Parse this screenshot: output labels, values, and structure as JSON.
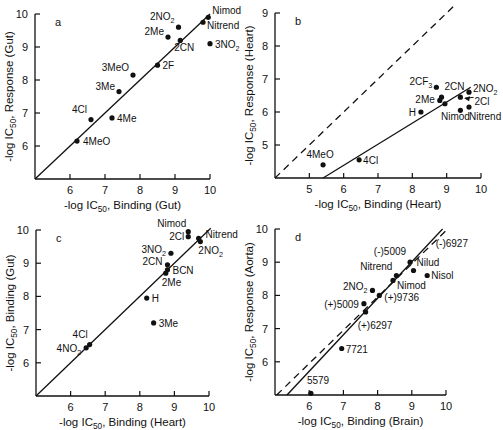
{
  "figure": {
    "panels": [
      "a",
      "b",
      "c",
      "d"
    ]
  },
  "chart_data": [
    {
      "id": "a",
      "type": "scatter",
      "panel_label": "a",
      "xlabel": "-log IC50, Binding (Gut)",
      "ylabel": "-log IC50, Response (Gut)",
      "xlim": [
        5,
        10
      ],
      "ylim": [
        5,
        10
      ],
      "xticks": [
        "6",
        "7",
        "8",
        "9",
        "10"
      ],
      "yticks": [
        "6",
        "7",
        "8",
        "9",
        "10"
      ],
      "box": {
        "x0": 35,
        "x1": 210,
        "y0": 179,
        "y1": 14
      },
      "lines": [
        {
          "style": "solid",
          "from": [
            5,
            5
          ],
          "to": [
            10,
            10
          ]
        }
      ],
      "points": [
        {
          "label": "4MeO",
          "x": 6.2,
          "y": 6.15,
          "lx": 6,
          "ly": 4,
          "anchor": "start"
        },
        {
          "label": "4Cl",
          "x": 6.6,
          "y": 6.8,
          "lx": -4,
          "ly": -7,
          "anchor": "end"
        },
        {
          "label": "4Me",
          "x": 7.2,
          "y": 6.85,
          "lx": 5,
          "ly": 4,
          "anchor": "start"
        },
        {
          "label": "3Me",
          "x": 7.4,
          "y": 7.65,
          "lx": -4,
          "ly": -2,
          "anchor": "end"
        },
        {
          "label": "3MeO",
          "x": 7.8,
          "y": 8.15,
          "lx": -4,
          "ly": -4,
          "anchor": "end"
        },
        {
          "label": "2F",
          "x": 8.5,
          "y": 8.45,
          "lx": 5,
          "ly": 4,
          "anchor": "start"
        },
        {
          "label": "2Me",
          "x": 8.8,
          "y": 9.3,
          "lx": -4,
          "ly": -2,
          "anchor": "end"
        },
        {
          "label": "2CN",
          "x": 9.15,
          "y": 9.2,
          "lx": -6,
          "ly": 11,
          "anchor": "start"
        },
        {
          "label": "2NO2",
          "x": 9.1,
          "y": 9.6,
          "lx": -4,
          "ly": -7,
          "anchor": "end"
        },
        {
          "label": "Nitrend",
          "x": 9.8,
          "y": 9.75,
          "lx": 4,
          "ly": 7,
          "anchor": "start"
        },
        {
          "label": "Nimod",
          "x": 9.95,
          "y": 9.9,
          "lx": 4,
          "ly": -3,
          "anchor": "start"
        },
        {
          "label": "3NO2",
          "x": 10.0,
          "y": 9.1,
          "lx": 5,
          "ly": 4,
          "anchor": "start"
        }
      ]
    },
    {
      "id": "b",
      "type": "scatter",
      "panel_label": "b",
      "xlabel": "-log IC50, Binding (Heart)",
      "ylabel": "-log IC50, Response (Heart)",
      "xlim": [
        4,
        10
      ],
      "ylim": [
        4,
        9
      ],
      "xticks": [
        "5",
        "6",
        "7",
        "8",
        "9",
        "10"
      ],
      "yticks": [
        "5",
        "6",
        "7",
        "8",
        "9"
      ],
      "box": {
        "x0": 275,
        "x1": 481,
        "y0": 178,
        "y1": 13
      },
      "lines": [
        {
          "style": "dashed",
          "from": [
            4,
            4
          ],
          "to": [
            9.2,
            9.2
          ]
        },
        {
          "style": "solid",
          "from": [
            5.4,
            4
          ],
          "to": [
            9.7,
            6.75
          ]
        }
      ],
      "points": [
        {
          "label": "4MeO",
          "x": 5.4,
          "y": 4.4,
          "lx": -3,
          "ly": -7,
          "anchor": "middle"
        },
        {
          "label": "4Cl",
          "x": 6.45,
          "y": 4.55,
          "lx": 4,
          "ly": 4,
          "anchor": "start"
        },
        {
          "label": "H",
          "x": 8.25,
          "y": 6.0,
          "lx": -5,
          "ly": 4,
          "anchor": "end"
        },
        {
          "label": "2CF3",
          "x": 8.7,
          "y": 6.75,
          "lx": -4,
          "ly": -2,
          "anchor": "end"
        },
        {
          "label": "2Me",
          "x": 8.8,
          "y": 6.35,
          "lx": -5,
          "ly": 3,
          "anchor": "end"
        },
        {
          "label": "2CN",
          "x": 8.85,
          "y": 6.45,
          "lx": 3,
          "ly": -7,
          "anchor": "start"
        },
        {
          "label": "Nimod",
          "x": 8.95,
          "y": 6.25,
          "lx": -4,
          "ly": 16,
          "anchor": "start"
        },
        {
          "label": "Nimod-pt2",
          "x": 9.4,
          "y": 6.05,
          "lx": 0,
          "ly": 0,
          "anchor": "start",
          "hide_label": true
        },
        {
          "label": "2Cl",
          "x": 9.4,
          "y": 6.45,
          "lx": 0,
          "ly": 0,
          "anchor": "start",
          "hide_label": true
        },
        {
          "label": "2NO2",
          "x": 9.65,
          "y": 6.6,
          "lx": 4,
          "ly": 0,
          "anchor": "start"
        },
        {
          "label": "Nitrend",
          "x": 9.65,
          "y": 6.15,
          "lx": 0,
          "ly": 13,
          "anchor": "start"
        }
      ],
      "annotations": [
        {
          "label": "2Cl",
          "text_x": 10.25,
          "text_y": 6.2,
          "arrow_to": [
            9.45,
            6.45
          ]
        }
      ]
    },
    {
      "id": "c",
      "type": "scatter",
      "panel_label": "c",
      "xlabel": "-log IC50, Binding (Heart)",
      "ylabel": "-log IC50, Binding (Gut)",
      "xlim": [
        5,
        10
      ],
      "ylim": [
        5,
        10
      ],
      "xticks": [
        "6",
        "7",
        "8",
        "9",
        "10"
      ],
      "yticks": [
        "6",
        "7",
        "8",
        "9",
        "10"
      ],
      "box": {
        "x0": 36,
        "x1": 209,
        "y0": 396,
        "y1": 230
      },
      "lines": [
        {
          "style": "solid",
          "from": [
            5,
            5
          ],
          "to": [
            10.05,
            10.05
          ]
        }
      ],
      "points": [
        {
          "label": "4NO2",
          "x": 6.45,
          "y": 6.45,
          "lx": -5,
          "ly": 4,
          "anchor": "end"
        },
        {
          "label": "4Cl",
          "x": 6.55,
          "y": 6.55,
          "lx": -2,
          "ly": -7,
          "anchor": "end"
        },
        {
          "label": "3Me",
          "x": 8.4,
          "y": 7.2,
          "lx": 5,
          "ly": 4,
          "anchor": "start"
        },
        {
          "label": "H",
          "x": 8.2,
          "y": 7.95,
          "lx": 5,
          "ly": 4,
          "anchor": "start"
        },
        {
          "label": "2Me",
          "x": 8.75,
          "y": 8.7,
          "lx": -4,
          "ly": 13,
          "anchor": "start"
        },
        {
          "label": "BCN",
          "x": 8.8,
          "y": 8.8,
          "lx": 5,
          "ly": 4,
          "anchor": "start"
        },
        {
          "label": "2CN",
          "x": 8.8,
          "y": 8.95,
          "lx": -5,
          "ly": 0,
          "anchor": "end"
        },
        {
          "label": "3NO2",
          "x": 8.9,
          "y": 9.3,
          "lx": -5,
          "ly": 0,
          "anchor": "end"
        },
        {
          "label": "2Cl",
          "x": 9.4,
          "y": 9.8,
          "lx": -4,
          "ly": 3,
          "anchor": "end"
        },
        {
          "label": "Nimod",
          "x": 9.4,
          "y": 9.95,
          "lx": -2,
          "ly": -5,
          "anchor": "end"
        },
        {
          "label": "Nitrend",
          "x": 9.7,
          "y": 9.75,
          "lx": 7,
          "ly": 0,
          "anchor": "start"
        },
        {
          "label": "2NO2",
          "x": 9.75,
          "y": 9.65,
          "lx": -2,
          "ly": 12,
          "anchor": "start"
        }
      ]
    },
    {
      "id": "d",
      "type": "scatter",
      "panel_label": "d",
      "xlabel": "-log IC50, Binding (Brain)",
      "ylabel": "-log IC50, Response (Aorta)",
      "xlim": [
        5,
        10
      ],
      "ylim": [
        5,
        10
      ],
      "xticks": [
        "6",
        "7",
        "8",
        "9",
        "10"
      ],
      "yticks": [
        "6",
        "7",
        "8",
        "9",
        "10"
      ],
      "box": {
        "x0": 275,
        "x1": 446,
        "y0": 395,
        "y1": 229
      },
      "lines": [
        {
          "style": "dashed",
          "from": [
            5.05,
            5
          ],
          "to": [
            10.05,
            10.0
          ]
        },
        {
          "style": "solid",
          "from": [
            5.35,
            5
          ],
          "to": [
            9.9,
            10.0
          ]
        }
      ],
      "points": [
        {
          "label": "5579",
          "x": 6.05,
          "y": 5.05,
          "lx": -4,
          "ly": -9,
          "anchor": "start"
        },
        {
          "label": "7721",
          "x": 6.95,
          "y": 6.4,
          "lx": 4,
          "ly": 4,
          "anchor": "start"
        },
        {
          "label": "(+)6297",
          "x": 7.65,
          "y": 7.5,
          "lx": -8,
          "ly": 17,
          "anchor": "start"
        },
        {
          "label": "(+)5009",
          "x": 7.6,
          "y": 7.75,
          "lx": -5,
          "ly": 4,
          "anchor": "end"
        },
        {
          "label": "2NO2",
          "x": 7.85,
          "y": 8.15,
          "lx": -5,
          "ly": 0,
          "anchor": "end"
        },
        {
          "label": "(+)9736",
          "x": 8.05,
          "y": 8.0,
          "lx": 5,
          "ly": 6,
          "anchor": "start"
        },
        {
          "label": "Nimod",
          "x": 8.45,
          "y": 8.45,
          "lx": 4,
          "ly": 9,
          "anchor": "start"
        },
        {
          "label": "Nitrend",
          "x": 8.55,
          "y": 8.6,
          "lx": -4,
          "ly": -5,
          "anchor": "end"
        },
        {
          "label": "(-)5009",
          "x": 8.95,
          "y": 9.0,
          "lx": -4,
          "ly": -7,
          "anchor": "end"
        },
        {
          "label": "Nilud",
          "x": 9.05,
          "y": 8.75,
          "lx": 3,
          "ly": -5,
          "anchor": "start"
        },
        {
          "label": "Nisol",
          "x": 9.45,
          "y": 8.6,
          "lx": 4,
          "ly": 4,
          "anchor": "start"
        }
      ],
      "annotations": [
        {
          "label": "(-)6927",
          "text_x": 9.7,
          "text_y": 9.45
        }
      ]
    }
  ]
}
